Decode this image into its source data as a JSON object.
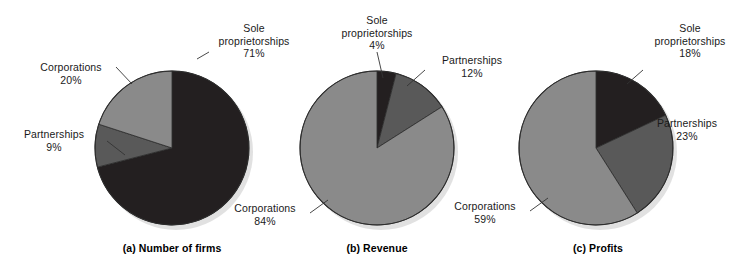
{
  "figure": {
    "background": "#ffffff",
    "width": 732,
    "height": 273
  },
  "palette": {
    "sole_proprietorships": "#231f20",
    "partnerships": "#595959",
    "corporations": "#8a8a8a",
    "outline": "#2b2b2b",
    "text": "#1a1a1a",
    "leader_line": "#333333",
    "shadow": "#c9c9c9"
  },
  "legend_terms": {
    "sole_proprietorships": "Sole proprietorships",
    "partnerships": "Partnerships",
    "corporations": "Corporations"
  },
  "panels": [
    {
      "id": "a",
      "caption": "(a) Number of firms",
      "labels": {
        "sole_line1": "Sole",
        "sole_line2": "proprietorships",
        "sole_value": "71%",
        "partnerships_name": "Partnerships",
        "partnerships_value": "9%",
        "corporations_name": "Corporations",
        "corporations_value": "20%"
      }
    },
    {
      "id": "b",
      "caption": "(b) Revenue",
      "labels": {
        "sole_line1": "Sole",
        "sole_line2": "proprietorships",
        "sole_value": "4%",
        "partnerships_name": "Partnerships",
        "partnerships_value": "12%",
        "corporations_name": "Corporations",
        "corporations_value": "84%"
      }
    },
    {
      "id": "c",
      "caption": "(c) Profits",
      "labels": {
        "sole_line1": "Sole",
        "sole_line2": "proprietorships",
        "sole_value": "18%",
        "partnerships_name": "Partnerships",
        "partnerships_value": "23%",
        "corporations_name": "Corporations",
        "corporations_value": "59%"
      }
    }
  ],
  "chart_data": [
    {
      "type": "pie",
      "title": "(a) Number of firms",
      "categories": [
        "Sole proprietorships",
        "Partnerships",
        "Corporations"
      ],
      "values": [
        71,
        9,
        20
      ],
      "unit": "percent",
      "colors": [
        "#231f20",
        "#595959",
        "#8a8a8a"
      ],
      "start_angle_deg": 0,
      "direction": "clockwise",
      "legend": "labels-with-leader-lines",
      "grid": false
    },
    {
      "type": "pie",
      "title": "(b) Revenue",
      "categories": [
        "Sole proprietorships",
        "Partnerships",
        "Corporations"
      ],
      "values": [
        4,
        12,
        84
      ],
      "unit": "percent",
      "colors": [
        "#231f20",
        "#595959",
        "#8a8a8a"
      ],
      "start_angle_deg": 0,
      "direction": "clockwise",
      "legend": "labels-with-leader-lines",
      "grid": false
    },
    {
      "type": "pie",
      "title": "(c) Profits",
      "categories": [
        "Sole proprietorships",
        "Partnerships",
        "Corporations"
      ],
      "values": [
        18,
        23,
        59
      ],
      "unit": "percent",
      "colors": [
        "#231f20",
        "#595959",
        "#8a8a8a"
      ],
      "start_angle_deg": 0,
      "direction": "clockwise",
      "legend": "labels-with-leader-lines",
      "grid": false
    }
  ]
}
